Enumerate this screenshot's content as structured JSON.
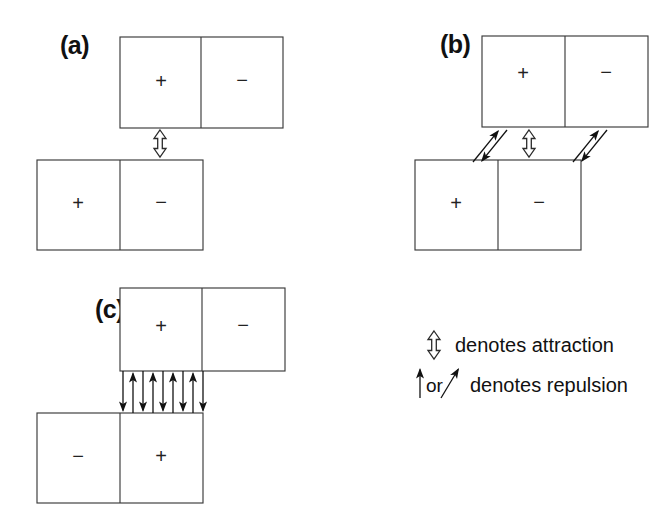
{
  "figure": {
    "title": "Schematic of attraction and repulsion between charged domain pairs",
    "background_color": "#ffffff",
    "line_color": "#3a3a3a",
    "arrow_color": "#111111",
    "width": 671,
    "height": 518
  },
  "panels": [
    {
      "id": "a",
      "label": "(a)",
      "label_x": 60,
      "label_y": 54,
      "top_block": {
        "x": 120,
        "y": 37,
        "width": 163,
        "height": 91,
        "cells": [
          {
            "sign": "+",
            "cx": 161,
            "cy": 83
          },
          {
            "sign": "−",
            "cx": 242,
            "cy": 82
          }
        ],
        "divider_x": 201
      },
      "bottom_block": {
        "x": 37,
        "y": 160,
        "width": 166,
        "height": 90,
        "cells": [
          {
            "sign": "+",
            "cx": 78,
            "cy": 205
          },
          {
            "sign": "−",
            "cx": 161,
            "cy": 204
          }
        ],
        "divider_x": 120
      },
      "attraction_arrows": [
        {
          "cx": 160,
          "top": 130,
          "bottom": 157
        }
      ],
      "repulsion_arrows": []
    },
    {
      "id": "b",
      "label": "(b)",
      "label_x": 440,
      "label_y": 53,
      "top_block": {
        "x": 482,
        "y": 36,
        "width": 166,
        "height": 91,
        "cells": [
          {
            "sign": "+",
            "cx": 523,
            "cy": 75
          },
          {
            "sign": "−",
            "cx": 606,
            "cy": 74
          }
        ],
        "divider_x": 565
      },
      "bottom_block": {
        "x": 415,
        "y": 160,
        "width": 166,
        "height": 90,
        "cells": [
          {
            "sign": "+",
            "cx": 456,
            "cy": 205
          },
          {
            "sign": "−",
            "cx": 539,
            "cy": 204
          }
        ],
        "divider_x": 498
      },
      "attraction_arrows": [
        {
          "cx": 529,
          "top": 130,
          "bottom": 157
        }
      ],
      "repulsion_arrows": [
        {
          "x_low": 473,
          "y_low": 162,
          "x_high": 499,
          "y_high": 130,
          "offset": 8
        },
        {
          "x_low": 573,
          "y_low": 162,
          "x_high": 599,
          "y_high": 130,
          "offset": 8
        }
      ]
    },
    {
      "id": "c",
      "label": "(c)",
      "label_x": 95,
      "label_y": 318,
      "top_block": {
        "x": 120,
        "y": 288,
        "width": 165,
        "height": 83,
        "cells": [
          {
            "sign": "+",
            "cx": 161,
            "cy": 328
          },
          {
            "sign": "−",
            "cx": 243,
            "cy": 327
          }
        ],
        "divider_x": 202
      },
      "bottom_block": {
        "x": 37,
        "y": 413,
        "width": 166,
        "height": 90,
        "cells": [
          {
            "sign": "−",
            "cx": 78,
            "cy": 458
          },
          {
            "sign": "+",
            "cx": 161,
            "cy": 458
          }
        ],
        "divider_x": 120
      },
      "attraction_arrows": [],
      "vertical_repulsion": {
        "y_top": 371,
        "y_bottom": 413,
        "arrows": [
          {
            "x": 123,
            "direction": "down"
          },
          {
            "x": 133,
            "direction": "up"
          },
          {
            "x": 143,
            "direction": "down"
          },
          {
            "x": 153,
            "direction": "up"
          },
          {
            "x": 163,
            "direction": "down"
          },
          {
            "x": 173,
            "direction": "up"
          },
          {
            "x": 183,
            "direction": "down"
          },
          {
            "x": 193,
            "direction": "up"
          },
          {
            "x": 203,
            "direction": "down"
          }
        ]
      }
    }
  ],
  "legend": {
    "x": 418,
    "y": 330,
    "entries": [
      {
        "id": "attraction",
        "symbol": "double-headed-hollow-arrow",
        "text": "denotes attraction",
        "symbol_cx": 434,
        "symbol_top": 331,
        "symbol_bottom": 359,
        "text_x": 455,
        "text_y": 352
      },
      {
        "id": "repulsion",
        "symbol": "vertical-and-diagonal-solid-arrow",
        "text": "denotes repulsion",
        "connector_text": "or",
        "vertical_x": 420,
        "vertical_top": 368,
        "vertical_bottom": 398,
        "connector_x": 426,
        "connector_y": 392,
        "diagonal_x1": 441,
        "diagonal_y1": 398,
        "diagonal_x2": 459,
        "diagonal_y2": 368,
        "text_x": 470,
        "text_y": 392
      }
    ]
  }
}
